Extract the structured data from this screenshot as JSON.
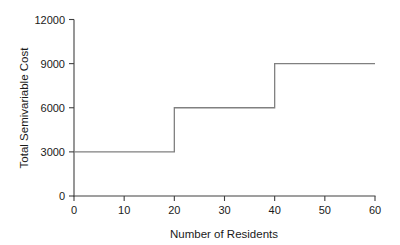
{
  "chart_data": {
    "type": "line",
    "step": "post",
    "title": "",
    "xlabel": "Number of Residents",
    "ylabel": "Total Semivariable Cost",
    "xlim": [
      0,
      60
    ],
    "ylim": [
      0,
      12000
    ],
    "xticks": [
      0,
      10,
      20,
      30,
      40,
      50,
      60
    ],
    "yticks": [
      0,
      3000,
      6000,
      9000,
      12000
    ],
    "xticklabels": [
      "0",
      "10",
      "20",
      "30",
      "40",
      "50",
      "60"
    ],
    "yticklabels": [
      "0",
      "3000",
      "6000",
      "9000",
      "12000"
    ],
    "grid": false,
    "legend": null,
    "series": [
      {
        "name": "Total Semivariable Cost",
        "color": "#808080",
        "x": [
          0,
          20,
          20,
          40,
          40,
          60
        ],
        "y": [
          3000,
          3000,
          6000,
          6000,
          9000,
          9000
        ],
        "steps": [
          {
            "x_start": 0,
            "x_end": 20,
            "value": 3000
          },
          {
            "x_start": 20,
            "x_end": 40,
            "value": 6000
          },
          {
            "x_start": 40,
            "x_end": 60,
            "value": 9000
          }
        ]
      }
    ]
  },
  "style": {
    "background": "#ffffff",
    "line_color": "#808080",
    "axis_color": "#404040",
    "text_color": "#1a1a1a"
  }
}
